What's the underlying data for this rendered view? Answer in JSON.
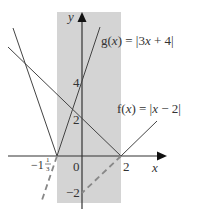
{
  "figure": {
    "shaded_region": {
      "x_from": -1.333,
      "x_to": 2,
      "color": "#d4d4d4"
    },
    "axes": {
      "x_label": "x",
      "y_label": "y",
      "origin_label": "0",
      "x_ticks": [
        {
          "value": -1.333,
          "label_whole": "−1",
          "label_num": "1",
          "label_den": "3"
        },
        {
          "value": 2,
          "label": "2"
        }
      ],
      "y_ticks": [
        {
          "value": 4,
          "label": "4"
        },
        {
          "value": 2,
          "label": "2"
        },
        {
          "value": -2,
          "label": "−2"
        }
      ]
    },
    "functions": [
      {
        "name": "g",
        "label": "g(x) = |3x + 4|",
        "label_name": "g(",
        "label_var": "x",
        "label_rest": ") = |3",
        "label_var2": "x",
        "label_tail": " + 4|"
      },
      {
        "name": "f",
        "label": "f(x) = |x − 2|",
        "label_name": "f(",
        "label_var": "x",
        "label_rest": ") = |",
        "label_var2": "x",
        "label_tail": " − 2|"
      }
    ],
    "dashed_lines": [
      {
        "desc": "reflection of y = 3x + 4 below x-axis"
      },
      {
        "desc": "reflection of y = x - 2 below x-axis"
      }
    ]
  }
}
